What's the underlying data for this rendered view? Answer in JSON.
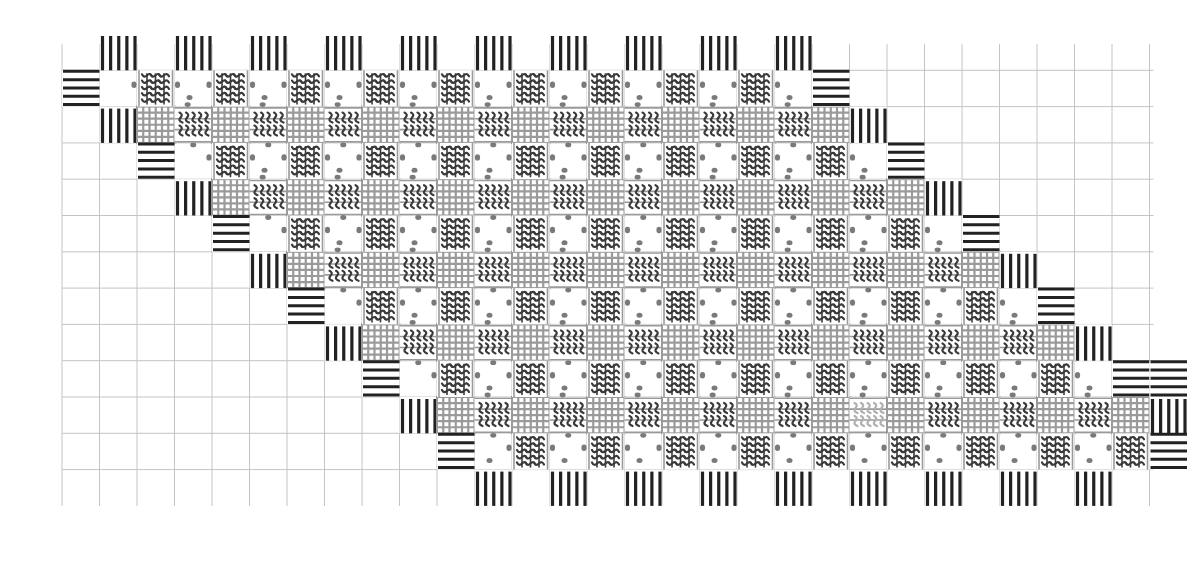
{
  "diagram": {
    "title": "",
    "type": "needlework-lattice-stitch-chart",
    "canvas": {
      "width": 1202,
      "height": 564,
      "background": "#ffffff"
    },
    "grid": {
      "origin_x": 62,
      "origin_y": 34,
      "cell_w": 37.5,
      "cell_h": 36.3,
      "cols": 29,
      "rows": 13,
      "visible_from_y": 70,
      "line_color": "#c4c4c4",
      "line_width": 1
    },
    "pattern": {
      "steps": 5,
      "step_dx_cells": 2,
      "step_dy_cells": 2,
      "crossings_per_band": 10,
      "band_first_col": 2,
      "band_first_row": 2,
      "stripe_lines": 5
    },
    "colors": {
      "stripe": "#222222",
      "lattice": "#9a9a9a",
      "chain": "#3a3a3a",
      "chain_light": "#b0b0b0",
      "dot": "#7a7a7a"
    },
    "faded_chain_cells": [
      {
        "band": 4,
        "index": 5
      }
    ],
    "legend": []
  }
}
